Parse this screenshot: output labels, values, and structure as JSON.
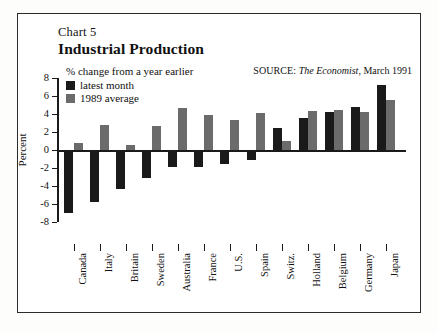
{
  "figure": {
    "chart_number": "Chart 5",
    "title": "Industrial Production",
    "subcaption": "% change from a year earlier",
    "source": {
      "label": "SOURCE:",
      "publication": "The Economist",
      "date": ", March 1991"
    }
  },
  "legend": {
    "items": [
      {
        "label": "latest month",
        "color": "#1a1a1a"
      },
      {
        "label": "1989 average",
        "color": "#6b6b6b"
      }
    ]
  },
  "axes": {
    "y_title": "Percent",
    "y_ticks": [
      "8",
      "6",
      "4",
      "2",
      "0",
      "-2",
      "-4",
      "-6",
      "-8"
    ]
  },
  "chart_data": {
    "type": "bar",
    "title": "Industrial Production",
    "subtitle": "% change from a year earlier",
    "xlabel": "",
    "ylabel": "Percent",
    "ylim": [
      -8,
      8
    ],
    "ytick_step": 2,
    "grid": false,
    "legend_position": "top-left",
    "categories": [
      "Canada",
      "Italy",
      "Britain",
      "Sweden",
      "Australia",
      "France",
      "U.S.",
      "Spain",
      "Switz.",
      "Holland",
      "Belgium",
      "Germany",
      "Japan"
    ],
    "series": [
      {
        "name": "latest month",
        "color": "#1a1a1a",
        "values": [
          -7.0,
          -5.8,
          -4.3,
          -3.1,
          -1.9,
          -1.9,
          -1.5,
          -1.1,
          2.4,
          3.6,
          4.2,
          4.8,
          7.2
        ]
      },
      {
        "name": "1989 average",
        "color": "#6b6b6b",
        "values": [
          0.8,
          2.8,
          0.6,
          2.7,
          4.7,
          3.9,
          3.3,
          4.1,
          1.0,
          4.3,
          4.4,
          4.2,
          5.6
        ]
      }
    ]
  }
}
